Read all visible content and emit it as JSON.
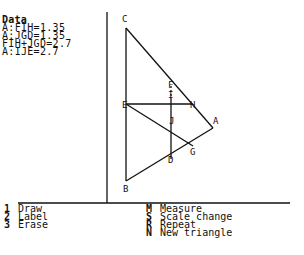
{
  "data_panel": {
    "title": "Data",
    "lines": [
      "A:FIH=1.35",
      "A:JGD=1.35",
      "FIH+JGD=2.7",
      "A:IJE=2.7"
    ]
  },
  "figure": {
    "points": {
      "C": {
        "label": "C"
      },
      "E": {
        "label": "E"
      },
      "B": {
        "label": "B"
      },
      "A": {
        "label": "A"
      },
      "H": {
        "label": "H"
      },
      "F": {
        "label": "F"
      },
      "I": {
        "label": "I"
      },
      "J": {
        "label": "J"
      },
      "G": {
        "label": "G"
      },
      "D": {
        "label": "D"
      }
    }
  },
  "menu": {
    "left": [
      {
        "key": "1",
        "label": "Draw"
      },
      {
        "key": "2",
        "label": "Label"
      },
      {
        "key": "3",
        "label": "Erase"
      }
    ],
    "right": [
      {
        "key": "M",
        "label": "Measure"
      },
      {
        "key": "S",
        "label": "Scale change"
      },
      {
        "key": "R",
        "label": "Repeat"
      },
      {
        "key": "N",
        "label": "New triangle"
      }
    ]
  },
  "colors": {
    "ink": "#111111",
    "background": "#ffffff"
  }
}
